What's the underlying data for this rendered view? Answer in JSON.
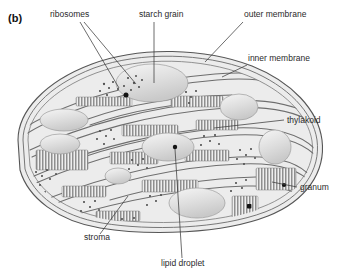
{
  "figure": {
    "panel_label": "(b)",
    "background_color": "#ffffff",
    "stroke_color": "#4a4a4a",
    "text_color": "#2a2a2a",
    "body_fill": "#ececec",
    "organelle_fill": "#e4e4e4",
    "starch_fill": "#dcdcdc",
    "granum_fill": "#9a9a9a",
    "lipid_fill": "#111111"
  },
  "labels": [
    {
      "id": "ribosomes",
      "text": "ribosomes",
      "x": 50,
      "y": 17,
      "anchor": "start"
    },
    {
      "id": "starch-grain",
      "text": "starch grain",
      "x": 139,
      "y": 17,
      "anchor": "start"
    },
    {
      "id": "outer-membrane",
      "text": "outer membrane",
      "x": 244,
      "y": 17,
      "anchor": "start"
    },
    {
      "id": "inner-membrane",
      "text": "inner membrane",
      "x": 248,
      "y": 61,
      "anchor": "start"
    },
    {
      "id": "thylakoid",
      "text": "thylakoid",
      "x": 287,
      "y": 123,
      "anchor": "start"
    },
    {
      "id": "granum",
      "text": "granum",
      "x": 300,
      "y": 190,
      "anchor": "start"
    },
    {
      "id": "stroma",
      "text": "stroma",
      "x": 84,
      "y": 240,
      "anchor": "start"
    },
    {
      "id": "lipid-droplet",
      "text": "lipid droplet",
      "x": 161,
      "y": 266,
      "anchor": "start"
    }
  ],
  "structures": {
    "outer_membrane_label": "outer membrane",
    "inner_membrane_label": "inner membrane",
    "thylakoid_label": "thylakoid",
    "granum_label": "granum",
    "stroma_label": "stroma",
    "starch_grain_label": "starch grain",
    "ribosome_label": "ribosomes",
    "lipid_droplet_label": "lipid droplet"
  }
}
